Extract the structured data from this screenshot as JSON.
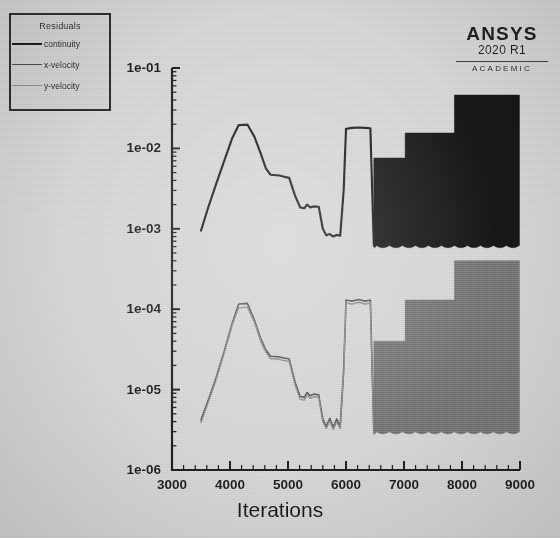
{
  "app": {
    "vendor": "ANSYS",
    "version": "2020 R1",
    "edition": "ACADEMIC"
  },
  "legend": {
    "title": "Residuals",
    "items": [
      {
        "label": "continuity",
        "color": "#1a1a1a",
        "width": 2.2
      },
      {
        "label": "x-velocity",
        "color": "#4a4a4a",
        "width": 1.6
      },
      {
        "label": "y-velocity",
        "color": "#7a7a7a",
        "width": 1.4
      }
    ]
  },
  "chart_data": {
    "type": "line",
    "title": "",
    "xlabel": "Iterations",
    "ylabel": "",
    "yscale": "log",
    "xlim": [
      3000,
      9000
    ],
    "ylim": [
      1e-06,
      0.1
    ],
    "grid": false,
    "legend_position": "top-left",
    "xticks": [
      3000,
      4000,
      5000,
      6000,
      7000,
      8000,
      9000
    ],
    "xtick_labels": [
      "3000",
      "4000",
      "5000",
      "6000",
      "7000",
      "8000",
      "9000"
    ],
    "xminor_per_interval": 5,
    "yticks": [
      0.1,
      0.01,
      0.001,
      0.0001,
      1e-05,
      1e-06
    ],
    "ytick_labels": [
      "1e-01",
      "1e-02",
      "1e-03",
      "1e-04",
      "1e-05",
      "1e-06"
    ],
    "series": [
      {
        "name": "continuity",
        "color": "#1a1a1a",
        "width": 2.2,
        "points": [
          [
            3500,
            0.00095
          ],
          [
            3620,
            0.0018
          ],
          [
            3760,
            0.0036
          ],
          [
            3900,
            0.007
          ],
          [
            4040,
            0.0135
          ],
          [
            4150,
            0.0195
          ],
          [
            4300,
            0.0198
          ],
          [
            4420,
            0.014
          ],
          [
            4530,
            0.0086
          ],
          [
            4620,
            0.0056
          ],
          [
            4700,
            0.0047
          ],
          [
            4850,
            0.0046
          ],
          [
            4960,
            0.0044
          ],
          [
            5020,
            0.0043
          ],
          [
            5120,
            0.0026
          ],
          [
            5210,
            0.00185
          ],
          [
            5280,
            0.0018
          ],
          [
            5330,
            0.002
          ],
          [
            5380,
            0.00185
          ],
          [
            5450,
            0.0019
          ],
          [
            5530,
            0.00188
          ],
          [
            5600,
            0.001
          ],
          [
            5660,
            0.00083
          ],
          [
            5720,
            0.00086
          ],
          [
            5780,
            0.0008
          ],
          [
            5840,
            0.00084
          ],
          [
            5900,
            0.00082
          ],
          [
            5960,
            0.003
          ],
          [
            6000,
            0.0175
          ],
          [
            6100,
            0.018
          ],
          [
            6220,
            0.0182
          ],
          [
            6330,
            0.018
          ],
          [
            6420,
            0.0178
          ],
          [
            6480,
            0.00062
          ]
        ],
        "oscillation_band": {
          "start_x": 6480,
          "end_x": 8990,
          "fill_color": "#151515",
          "baseline": 0.00062,
          "steps": [
            {
              "x0": 6480,
              "x1": 7020,
              "top": 0.0076
            },
            {
              "x0": 7020,
              "x1": 7870,
              "top": 0.0155
            },
            {
              "x0": 7870,
              "x1": 8990,
              "top": 0.046
            }
          ]
        }
      },
      {
        "name": "x-velocity",
        "color": "#4a4a4a",
        "width": 1.6,
        "points": [
          [
            3500,
            4.2e-06
          ],
          [
            3620,
            7.2e-06
          ],
          [
            3760,
            1.4e-05
          ],
          [
            3900,
            3e-05
          ],
          [
            4040,
            6.8e-05
          ],
          [
            4150,
            0.000116
          ],
          [
            4300,
            0.000118
          ],
          [
            4420,
            7.4e-05
          ],
          [
            4530,
            4.3e-05
          ],
          [
            4620,
            3.1e-05
          ],
          [
            4700,
            2.6e-05
          ],
          [
            4850,
            2.55e-05
          ],
          [
            4960,
            2.45e-05
          ],
          [
            5020,
            2.4e-05
          ],
          [
            5120,
            1.25e-05
          ],
          [
            5210,
            8.2e-06
          ],
          [
            5280,
            8e-06
          ],
          [
            5330,
            9.2e-06
          ],
          [
            5380,
            8.4e-06
          ],
          [
            5450,
            8.8e-06
          ],
          [
            5530,
            8.6e-06
          ],
          [
            5600,
            4.3e-06
          ],
          [
            5660,
            3.5e-06
          ],
          [
            5720,
            4.4e-06
          ],
          [
            5780,
            3.4e-06
          ],
          [
            5840,
            4.3e-06
          ],
          [
            5900,
            3.5e-06
          ],
          [
            5960,
            1.8e-05
          ],
          [
            6000,
            0.00013
          ],
          [
            6100,
            0.000126
          ],
          [
            6220,
            0.000132
          ],
          [
            6330,
            0.000126
          ],
          [
            6420,
            0.00013
          ],
          [
            6480,
            3e-06
          ]
        ],
        "oscillation_band": {
          "start_x": 6480,
          "end_x": 8990,
          "fill_color": "#6b6b6b",
          "baseline": 3e-06,
          "steps": [
            {
              "x0": 6480,
              "x1": 7020,
              "top": 4e-05
            },
            {
              "x0": 7020,
              "x1": 7870,
              "top": 0.00013
            },
            {
              "x0": 7870,
              "x1": 8990,
              "top": 0.0004
            }
          ]
        }
      },
      {
        "name": "y-velocity",
        "color": "#7a7a7a",
        "width": 1.4,
        "points": [
          [
            3500,
            3.9e-06
          ],
          [
            3620,
            6.8e-06
          ],
          [
            3760,
            1.32e-05
          ],
          [
            3900,
            2.85e-05
          ],
          [
            4040,
            6.4e-05
          ],
          [
            4150,
            0.000104
          ],
          [
            4300,
            0.000106
          ],
          [
            4420,
            6.9e-05
          ],
          [
            4530,
            4e-05
          ],
          [
            4620,
            2.9e-05
          ],
          [
            4700,
            2.42e-05
          ],
          [
            4850,
            2.38e-05
          ],
          [
            4960,
            2.28e-05
          ],
          [
            5020,
            2.24e-05
          ],
          [
            5120,
            1.16e-05
          ],
          [
            5210,
            7.6e-06
          ],
          [
            5280,
            7.4e-06
          ],
          [
            5330,
            8.6e-06
          ],
          [
            5380,
            7.8e-06
          ],
          [
            5450,
            8.2e-06
          ],
          [
            5530,
            8e-06
          ],
          [
            5600,
            4e-06
          ],
          [
            5660,
            3.3e-06
          ],
          [
            5720,
            4.1e-06
          ],
          [
            5780,
            3.2e-06
          ],
          [
            5840,
            4e-06
          ],
          [
            5900,
            3.3e-06
          ],
          [
            5960,
            1.65e-05
          ],
          [
            6000,
            0.00012
          ],
          [
            6100,
            0.000116
          ],
          [
            6220,
            0.000122
          ],
          [
            6330,
            0.000116
          ],
          [
            6420,
            0.00012
          ],
          [
            6480,
            2.8e-06
          ]
        ],
        "oscillation_band": null
      }
    ]
  }
}
